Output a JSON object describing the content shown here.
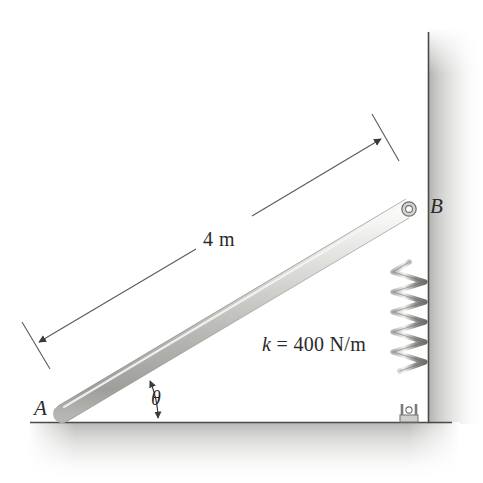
{
  "figure": {
    "type": "engineering-mechanics-diagram",
    "background_color": "#ffffff",
    "ink_color": "#2a2a2a"
  },
  "labels": {
    "point_a": "A",
    "point_b": "B",
    "angle": "θ",
    "length": "4 m",
    "stiffness_symbol": "k",
    "stiffness_equals": " = ",
    "stiffness_value": "400 N/m",
    "stiffness_full": "k = 400 N/m"
  },
  "geometry": {
    "rod": {
      "end_a": {
        "x": 62,
        "y": 414
      },
      "end_b": {
        "x": 404,
        "y": 210
      },
      "thickness_px": 17,
      "fill_light": "#e9e9e7",
      "fill_dark": "#a8a8a6",
      "length_label": "4 m"
    },
    "wall": {
      "x": 428,
      "y_top": 28,
      "y_bottom": 424,
      "shade_color": "#b9b9b7"
    },
    "ground": {
      "y": 422,
      "x_left": 28,
      "x_right": 460,
      "shade_color": "#b9b9b7"
    },
    "spring": {
      "anchor_top": {
        "x": 409,
        "y": 213
      },
      "anchor_bottom": {
        "x": 409,
        "y": 418
      },
      "coil_top_y": 262,
      "coil_bottom_y": 372,
      "coil_count": 7,
      "coil_half_width": 16,
      "wire_color": "#8d8d8b",
      "stiffness": "k = 400 N/m"
    },
    "dimension": {
      "label": "4 m",
      "from": {
        "x": 35,
        "y": 345
      },
      "to": {
        "x": 385,
        "y": 137
      },
      "gap_start": {
        "x": 196,
        "y": 249
      },
      "gap_end": {
        "x": 252,
        "y": 216
      }
    },
    "angle_arc": {
      "symbol": "θ",
      "vertex": {
        "x": 62,
        "y": 422
      },
      "radius_px": 96,
      "from_ground": true,
      "double_headed": true
    }
  }
}
